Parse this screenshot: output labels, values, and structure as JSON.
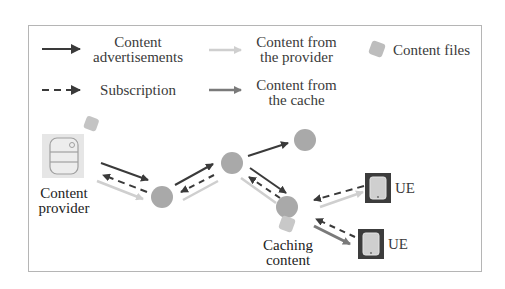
{
  "legend": {
    "content_advertisements": "Content\nadvertisements",
    "content_advertisements_l1": "Content",
    "content_advertisements_l2": "advertisements",
    "content_from_provider_l1": "Content from",
    "content_from_provider_l2": "the provider",
    "content_files": "Content files",
    "subscription": "Subscription",
    "content_from_cache_l1": "Content from",
    "content_from_cache_l2": "the cache"
  },
  "nodes": {
    "provider_l1": "Content",
    "provider_l2": "provider",
    "caching_l1": "Caching",
    "caching_l2": "content",
    "ue1": "UE",
    "ue2": "UE"
  },
  "colors": {
    "advert_arrow": "#3a3a3a",
    "provider_arrow": "#c8c8c8",
    "cache_arrow": "#7a7a7a",
    "node_fill": "#a9a9a9",
    "ue_box": "#3c3c3c",
    "content_file": "#bdbdbd"
  }
}
